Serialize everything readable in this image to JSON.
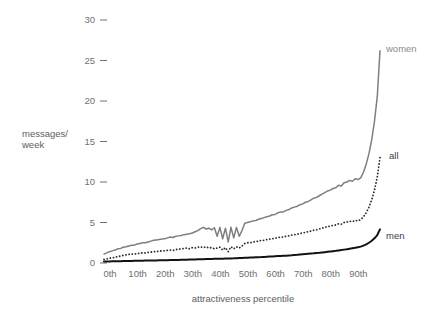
{
  "chart_data": {
    "type": "line",
    "title": "",
    "xlabel": "attractiveness percentile",
    "ylabel": "messages/ week",
    "ylabel_line1": "messages/",
    "ylabel_line2": "week",
    "xlim": [
      0,
      100
    ],
    "ylim": [
      0,
      30
    ],
    "grid": false,
    "legend_position": "right-inline",
    "y_ticks": [
      0,
      5,
      10,
      15,
      20,
      25,
      30
    ],
    "y_tick_labels": [
      "0",
      "5",
      "10",
      "15",
      "20",
      "25",
      "30"
    ],
    "x_ticks": [
      0,
      10,
      20,
      30,
      40,
      50,
      60,
      70,
      80,
      90
    ],
    "x_tick_labels": [
      "0th",
      "10th",
      "20th",
      "30th",
      "40th",
      "50th",
      "60th",
      "70th",
      "80th",
      "90th"
    ],
    "series": [
      {
        "name": "women",
        "label": "women",
        "style": "solid",
        "color": "#7d7e80",
        "width": 1.5,
        "x": [
          0,
          1,
          2,
          3,
          4,
          5,
          6,
          7,
          8,
          9,
          10,
          11,
          12,
          13,
          14,
          15,
          16,
          17,
          18,
          19,
          20,
          21,
          22,
          23,
          24,
          25,
          26,
          27,
          28,
          29,
          30,
          31,
          32,
          33,
          34,
          35,
          36,
          37,
          38,
          39,
          40,
          41,
          42,
          43,
          44,
          45,
          46,
          47,
          48,
          49,
          50,
          51,
          52,
          53,
          54,
          55,
          56,
          57,
          58,
          59,
          60,
          61,
          62,
          63,
          64,
          65,
          66,
          67,
          68,
          69,
          70,
          71,
          72,
          73,
          74,
          75,
          76,
          77,
          78,
          79,
          80,
          81,
          82,
          83,
          84,
          85,
          86,
          87,
          88,
          89,
          90,
          91,
          92,
          93,
          94,
          95,
          96,
          97,
          98,
          99,
          100
        ],
        "values": [
          1.1,
          1.25,
          1.4,
          1.5,
          1.6,
          1.75,
          1.8,
          1.95,
          2.0,
          2.1,
          2.2,
          2.2,
          2.35,
          2.4,
          2.5,
          2.5,
          2.6,
          2.7,
          2.8,
          2.85,
          2.9,
          2.95,
          3.0,
          3.1,
          3.2,
          3.15,
          3.3,
          3.35,
          3.4,
          3.5,
          3.55,
          3.6,
          3.7,
          3.85,
          4.0,
          4.25,
          4.4,
          4.2,
          4.3,
          4.1,
          4.35,
          3.3,
          4.4,
          3.0,
          4.3,
          2.6,
          4.4,
          3.1,
          4.4,
          3.3,
          4.0,
          4.9,
          5.0,
          5.1,
          5.2,
          5.25,
          5.4,
          5.5,
          5.6,
          5.7,
          5.8,
          5.95,
          6.0,
          6.2,
          6.3,
          6.3,
          6.5,
          6.6,
          6.8,
          6.9,
          7.0,
          7.2,
          7.3,
          7.5,
          7.6,
          7.8,
          8.0,
          8.1,
          8.3,
          8.5,
          8.7,
          8.9,
          9.0,
          9.2,
          9.3,
          9.6,
          9.5,
          9.9,
          10.0,
          10.2,
          10.1,
          10.4,
          10.3,
          10.5,
          11.2,
          12.2,
          13.5,
          15.2,
          17.5,
          20.5,
          26.2
        ]
      },
      {
        "name": "all",
        "label": "all",
        "style": "dotted",
        "color": "#2b2c2e",
        "width": 1.8,
        "x": [
          0,
          1,
          2,
          3,
          4,
          5,
          6,
          7,
          8,
          9,
          10,
          11,
          12,
          13,
          14,
          15,
          16,
          17,
          18,
          19,
          20,
          21,
          22,
          23,
          24,
          25,
          26,
          27,
          28,
          29,
          30,
          31,
          32,
          33,
          34,
          35,
          36,
          37,
          38,
          39,
          40,
          41,
          42,
          43,
          44,
          45,
          46,
          47,
          48,
          49,
          50,
          51,
          52,
          53,
          54,
          55,
          56,
          57,
          58,
          59,
          60,
          61,
          62,
          63,
          64,
          65,
          66,
          67,
          68,
          69,
          70,
          71,
          72,
          73,
          74,
          75,
          76,
          77,
          78,
          79,
          80,
          81,
          82,
          83,
          84,
          85,
          86,
          87,
          88,
          89,
          90,
          91,
          92,
          93,
          94,
          95,
          96,
          97,
          98,
          99,
          100
        ],
        "values": [
          0.45,
          0.5,
          0.6,
          0.65,
          0.7,
          0.8,
          0.85,
          0.95,
          1.0,
          1.05,
          1.1,
          1.1,
          1.15,
          1.2,
          1.25,
          1.25,
          1.3,
          1.35,
          1.4,
          1.4,
          1.45,
          1.5,
          1.5,
          1.55,
          1.6,
          1.55,
          1.65,
          1.7,
          1.75,
          1.8,
          1.85,
          1.75,
          1.9,
          1.85,
          1.95,
          2.0,
          1.9,
          2.0,
          1.85,
          1.9,
          1.75,
          1.85,
          1.95,
          1.6,
          1.9,
          1.4,
          2.0,
          1.75,
          2.0,
          1.85,
          2.1,
          2.4,
          2.5,
          2.5,
          2.6,
          2.65,
          2.7,
          2.8,
          2.8,
          2.9,
          2.95,
          3.0,
          3.05,
          3.15,
          3.2,
          3.2,
          3.3,
          3.35,
          3.45,
          3.5,
          3.55,
          3.65,
          3.7,
          3.8,
          3.85,
          3.95,
          4.05,
          4.1,
          4.2,
          4.3,
          4.4,
          4.5,
          4.55,
          4.65,
          4.7,
          4.85,
          4.8,
          5.0,
          5.05,
          5.15,
          5.1,
          5.25,
          5.2,
          5.35,
          5.7,
          6.2,
          6.9,
          7.8,
          9.0,
          10.6,
          13.0
        ]
      },
      {
        "name": "men",
        "label": "men",
        "style": "solid",
        "color": "#111214",
        "width": 2.0,
        "x": [
          0,
          1,
          2,
          3,
          4,
          5,
          6,
          7,
          8,
          9,
          10,
          11,
          12,
          13,
          14,
          15,
          16,
          17,
          18,
          19,
          20,
          21,
          22,
          23,
          24,
          25,
          26,
          27,
          28,
          29,
          30,
          31,
          32,
          33,
          34,
          35,
          36,
          37,
          38,
          39,
          40,
          41,
          42,
          43,
          44,
          45,
          46,
          47,
          48,
          49,
          50,
          51,
          52,
          53,
          54,
          55,
          56,
          57,
          58,
          59,
          60,
          61,
          62,
          63,
          64,
          65,
          66,
          67,
          68,
          69,
          70,
          71,
          72,
          73,
          74,
          75,
          76,
          77,
          78,
          79,
          80,
          81,
          82,
          83,
          84,
          85,
          86,
          87,
          88,
          89,
          90,
          91,
          92,
          93,
          94,
          95,
          96,
          97,
          98,
          99,
          100
        ],
        "values": [
          0.18,
          0.19,
          0.2,
          0.21,
          0.22,
          0.22,
          0.23,
          0.24,
          0.25,
          0.25,
          0.26,
          0.27,
          0.27,
          0.28,
          0.29,
          0.3,
          0.3,
          0.31,
          0.32,
          0.32,
          0.33,
          0.34,
          0.35,
          0.35,
          0.36,
          0.37,
          0.38,
          0.38,
          0.39,
          0.4,
          0.41,
          0.42,
          0.43,
          0.44,
          0.45,
          0.46,
          0.47,
          0.48,
          0.49,
          0.5,
          0.51,
          0.52,
          0.53,
          0.54,
          0.55,
          0.56,
          0.57,
          0.58,
          0.6,
          0.61,
          0.62,
          0.64,
          0.65,
          0.67,
          0.68,
          0.7,
          0.72,
          0.73,
          0.75,
          0.77,
          0.79,
          0.81,
          0.83,
          0.85,
          0.87,
          0.89,
          0.91,
          0.94,
          0.96,
          0.99,
          1.01,
          1.04,
          1.07,
          1.1,
          1.13,
          1.16,
          1.19,
          1.23,
          1.26,
          1.3,
          1.34,
          1.38,
          1.42,
          1.46,
          1.5,
          1.55,
          1.6,
          1.65,
          1.7,
          1.76,
          1.82,
          1.88,
          1.95,
          2.02,
          2.15,
          2.3,
          2.5,
          2.75,
          3.05,
          3.45,
          4.15
        ]
      }
    ]
  },
  "labels": {
    "y_axis_title_line1": "messages/",
    "y_axis_title_line2": "week",
    "x_axis_title": "attractiveness percentile",
    "series_women": "women",
    "series_all": "all",
    "series_men": "men"
  },
  "colors": {
    "women": "#7d7e80",
    "all": "#2b2c2e",
    "men": "#111214",
    "tick_text": "#6f7072",
    "axis_title_text": "#5d5e60",
    "background": "#ffffff"
  }
}
